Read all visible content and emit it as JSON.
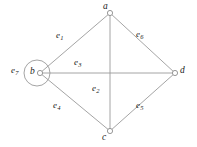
{
  "figure": {
    "type": "undirected-graph-diagram",
    "background_color": "#ffffff",
    "line_color": "#9a9a9a",
    "label_color": "#1b1b1b",
    "width": 197,
    "height": 147
  },
  "vertices": [
    {
      "id": "a",
      "label": "a",
      "x": 110,
      "y": 13,
      "label_x": 103,
      "label_y": 2,
      "marker": "open-circle"
    },
    {
      "id": "b",
      "label": "b",
      "x": 40,
      "y": 73,
      "label_x": 30,
      "label_y": 67,
      "marker": "open-circle"
    },
    {
      "id": "c",
      "label": "c",
      "x": 110,
      "y": 131,
      "label_x": 102,
      "label_y": 133,
      "marker": "open-circle"
    },
    {
      "id": "d",
      "label": "d",
      "x": 175,
      "y": 73,
      "label_x": 180,
      "label_y": 66,
      "marker": "open-circle"
    }
  ],
  "edges": [
    {
      "id": "e1",
      "label": "e",
      "sub": "1",
      "from": "b",
      "to": "a",
      "label_x": 56,
      "label_y": 31
    },
    {
      "id": "e2",
      "label": "e",
      "sub": "2",
      "from": "a",
      "to": "c",
      "label_x": 92,
      "label_y": 84
    },
    {
      "id": "e3",
      "label": "e",
      "sub": "3",
      "from": "b",
      "to": "d",
      "label_x": 74,
      "label_y": 58
    },
    {
      "id": "e4",
      "label": "e",
      "sub": "4",
      "from": "b",
      "to": "c",
      "label_x": 53,
      "label_y": 101
    },
    {
      "id": "e5",
      "label": "e",
      "sub": "5",
      "from": "c",
      "to": "d",
      "label_x": 136,
      "label_y": 101
    },
    {
      "id": "e6",
      "label": "e",
      "sub": "6",
      "from": "a",
      "to": "d",
      "label_x": 136,
      "label_y": 30
    },
    {
      "id": "e7",
      "label": "e",
      "sub": "7",
      "from": "b",
      "to": "b",
      "label_x": 11,
      "label_y": 66,
      "loop": true,
      "loop_cx": 37,
      "loop_cy": 73,
      "loop_r": 13
    }
  ]
}
